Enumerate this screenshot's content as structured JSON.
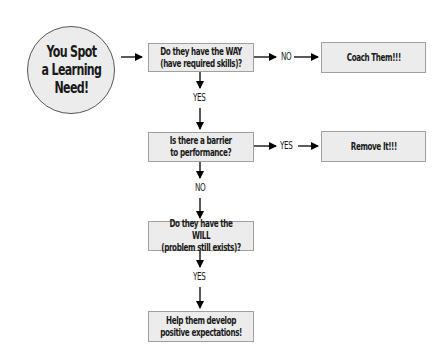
{
  "flowchart": {
    "start": {
      "label": "You Spot\na Learning\nNeed!"
    },
    "nodes": [
      {
        "id": "way",
        "label": "Do they have the WAY\n(have required skills)?"
      },
      {
        "id": "barrier",
        "label": "Is there a barrier\nto performance?"
      },
      {
        "id": "will",
        "label": "Do they have the WILL\n(problem still exists)?"
      },
      {
        "id": "expectations",
        "label": "Help them develop\npositive expectations!"
      }
    ],
    "outcomes": [
      {
        "id": "coach",
        "label": "Coach Them!!!"
      },
      {
        "id": "remove",
        "label": "Remove It!!!"
      }
    ],
    "edge_labels": {
      "way_no": "NO",
      "way_yes": "YES",
      "barrier_yes": "YES",
      "barrier_no": "NO",
      "will_yes": "YES"
    },
    "colors": {
      "fill": "#ececec",
      "box_border": "#a0a0a0",
      "circle_border": "#555555",
      "arrow": "#000000",
      "text": "#1a1a1a"
    }
  }
}
